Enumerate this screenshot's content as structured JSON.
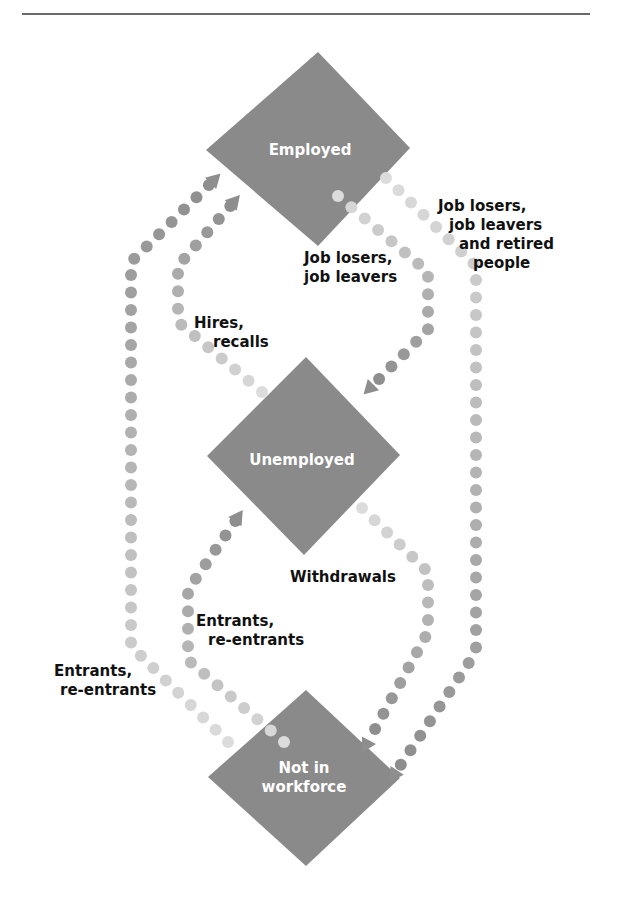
{
  "diagram": {
    "type": "labor-force-flow",
    "colors": {
      "node_fill": "#8a8a8a",
      "node_text": "#ffffff",
      "label_text": "#111111",
      "dot_light": "#dcdcdc",
      "dot_dark": "#8e8e8e",
      "rule": "#6a6a6a"
    },
    "nodes": [
      {
        "id": "employed",
        "label": "Employed"
      },
      {
        "id": "unemployed",
        "label": "Unemployed"
      },
      {
        "id": "not_in_workforce",
        "label_line1": "Not in",
        "label_line2": "workforce"
      }
    ],
    "flows": [
      {
        "id": "outer-left",
        "from": "not_in_workforce",
        "to": "employed",
        "lines": [
          "Entrants,",
          "re-entrants"
        ]
      },
      {
        "id": "hires",
        "from": "unemployed",
        "to": "employed",
        "lines": [
          "Hires,",
          "recalls"
        ]
      },
      {
        "id": "job-losers-unemployed",
        "from": "employed",
        "to": "unemployed",
        "lines": [
          "Job losers,",
          "job leavers"
        ]
      },
      {
        "id": "outer-right",
        "from": "employed",
        "to": "not_in_workforce",
        "lines": [
          "Job losers,",
          "job leavers",
          "and retired",
          "people"
        ]
      },
      {
        "id": "withdrawals",
        "from": "unemployed",
        "to": "not_in_workforce",
        "lines": [
          "Withdrawals"
        ]
      },
      {
        "id": "entrants-unemployed",
        "from": "not_in_workforce",
        "to": "unemployed",
        "lines": [
          "Entrants,",
          "re-entrants"
        ]
      }
    ]
  }
}
